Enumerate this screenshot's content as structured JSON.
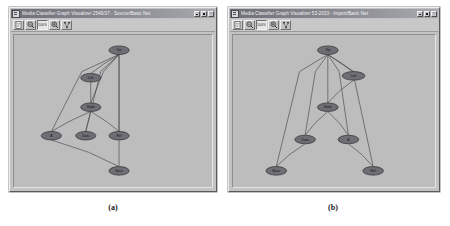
{
  "figure": {
    "captions": [
      {
        "id": "a",
        "text": "(a)"
      },
      {
        "id": "b",
        "text": "(b)"
      }
    ]
  },
  "windows": [
    {
      "id": "pane-a",
      "title": "Media Classifier Graph Visualizer 2549/37 - Source/Basic Net",
      "titlebar_buttons": {
        "minimize": "_",
        "maximize": "□",
        "close": "×"
      },
      "toolbar": {
        "buttons": [
          {
            "name": "new-document-button",
            "icon": "document-icon",
            "label": "",
            "active": false
          },
          {
            "name": "zoom-out-button",
            "icon": "magnifier-minus-icon",
            "label": "",
            "active": false
          },
          {
            "name": "zoom-level-button",
            "icon": "zoom-percent-icon",
            "label": "100%",
            "active": true
          },
          {
            "name": "zoom-in-button",
            "icon": "magnifier-plus-icon",
            "label": "",
            "active": false
          },
          {
            "name": "layout-button",
            "icon": "graph-layout-icon",
            "label": "",
            "active": false
          }
        ]
      },
      "graph": {
        "nodes": [
          {
            "id": "n0",
            "label": "Top",
            "x": 104,
            "y": 16,
            "rx": 10,
            "ry": 4.5
          },
          {
            "id": "n1",
            "label": "Link",
            "x": 76,
            "y": 45,
            "rx": 10,
            "ry": 4.5
          },
          {
            "id": "n2",
            "label": "Node",
            "x": 76,
            "y": 76,
            "rx": 10,
            "ry": 4.5
          },
          {
            "id": "n3",
            "label": "A",
            "x": 37,
            "y": 106,
            "rx": 10,
            "ry": 4.5
          },
          {
            "id": "n4",
            "label": "Data",
            "x": 71,
            "y": 106,
            "rx": 10,
            "ry": 4.5
          },
          {
            "id": "n5",
            "label": "Ref",
            "x": 104,
            "y": 106,
            "rx": 10,
            "ry": 4.5
          },
          {
            "id": "n6",
            "label": "Base",
            "x": 104,
            "y": 143,
            "rx": 10,
            "ry": 4.5
          }
        ],
        "edges": [
          {
            "from": "n0",
            "to": "n1"
          },
          {
            "from": "n0",
            "to": "n2"
          },
          {
            "from": "n0",
            "to": "n3"
          },
          {
            "from": "n0",
            "to": "n4"
          },
          {
            "from": "n0",
            "to": "n5"
          },
          {
            "from": "n0",
            "to": "n6"
          },
          {
            "from": "n1",
            "to": "n2"
          },
          {
            "from": "n2",
            "to": "n3"
          },
          {
            "from": "n2",
            "to": "n4"
          },
          {
            "from": "n2",
            "to": "n5"
          },
          {
            "from": "n3",
            "to": "n6"
          }
        ]
      }
    },
    {
      "id": "pane-b",
      "title": "Media Classifier Graph Visualizer 53-2033 - Import/Basic Net",
      "titlebar_buttons": {
        "minimize": "_",
        "maximize": "□",
        "close": "×"
      },
      "toolbar": {
        "buttons": [
          {
            "name": "new-document-button",
            "icon": "document-icon",
            "label": "",
            "active": false
          },
          {
            "name": "zoom-out-button",
            "icon": "magnifier-minus-icon",
            "label": "",
            "active": false
          },
          {
            "name": "zoom-level-button",
            "icon": "zoom-percent-icon",
            "label": "100%",
            "active": true
          },
          {
            "name": "zoom-in-button",
            "icon": "magnifier-plus-icon",
            "label": "",
            "active": false
          },
          {
            "name": "layout-button",
            "icon": "graph-layout-icon",
            "label": "",
            "active": false
          }
        ]
      },
      "graph": {
        "nodes": [
          {
            "id": "m0",
            "label": "Top",
            "x": 92,
            "y": 16,
            "rx": 10,
            "ry": 4.5
          },
          {
            "id": "m1",
            "label": "Link",
            "x": 117,
            "y": 43,
            "rx": 11,
            "ry": 4.5
          },
          {
            "id": "m2",
            "label": "Node",
            "x": 92,
            "y": 76,
            "rx": 10,
            "ry": 4.5
          },
          {
            "id": "m3",
            "label": "Data",
            "x": 70,
            "y": 110,
            "rx": 10,
            "ry": 4.5
          },
          {
            "id": "m4",
            "label": "A",
            "x": 112,
            "y": 110,
            "rx": 10,
            "ry": 4.5
          },
          {
            "id": "m5",
            "label": "Base",
            "x": 42,
            "y": 143,
            "rx": 10,
            "ry": 4.5
          },
          {
            "id": "m6",
            "label": "Ref",
            "x": 136,
            "y": 143,
            "rx": 10,
            "ry": 4.5
          }
        ],
        "edges": [
          {
            "from": "m0",
            "to": "m1"
          },
          {
            "from": "m0",
            "to": "m2"
          },
          {
            "from": "m0",
            "to": "m3"
          },
          {
            "from": "m0",
            "to": "m4"
          },
          {
            "from": "m0",
            "to": "m5"
          },
          {
            "from": "m0",
            "to": "m6"
          },
          {
            "from": "m1",
            "to": "m2"
          },
          {
            "from": "m2",
            "to": "m3"
          },
          {
            "from": "m2",
            "to": "m4"
          },
          {
            "from": "m3",
            "to": "m5"
          },
          {
            "from": "m4",
            "to": "m6"
          }
        ]
      }
    }
  ],
  "colors": {
    "window_face": "#c3c3c3",
    "titlebar_start": "#6f6f77",
    "titlebar_end": "#a9a9b0",
    "canvas": "#bdbdbd",
    "node_fill": "#6e6e74",
    "node_stroke": "#2e2e32",
    "edge": "#4e4e52",
    "page_background": "#ffffff"
  }
}
